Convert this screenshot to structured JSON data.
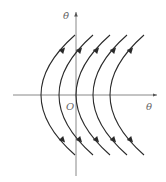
{
  "diagram": {
    "type": "phase-portrait",
    "axes": {
      "horizontal_label": "θ",
      "vertical_label": "θ̇",
      "origin_label": "O"
    },
    "curves": {
      "count": 5,
      "shape": "parabola opening left",
      "vertex_x": [
        41,
        59,
        76,
        93,
        110
      ],
      "arrow_direction_upper": "up-right",
      "arrow_direction_lower": "down-left"
    },
    "colors": {
      "curve": "#2a2a2a",
      "axis": "#7a7a7a",
      "background": "#ffffff"
    }
  }
}
